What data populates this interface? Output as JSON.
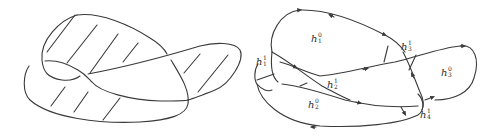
{
  "figure": {
    "left_panel": {
      "description": "hatched surface bounded by knotted curve",
      "hatch_count": 13
    },
    "right_panel": {
      "description": "handle decomposition with oriented boundary",
      "labels": [
        {
          "id": "h1_0",
          "base": "h",
          "sub": "1",
          "sup": "0",
          "x": 311,
          "y": 38
        },
        {
          "id": "h3_1",
          "base": "h",
          "sub": "3",
          "sup": "1",
          "x": 401,
          "y": 44
        },
        {
          "id": "h1_1",
          "base": "h",
          "sub": "1",
          "sup": "1",
          "x": 256,
          "y": 59
        },
        {
          "id": "h3_0",
          "base": "h",
          "sub": "3",
          "sup": "0",
          "x": 441,
          "y": 70
        },
        {
          "id": "h2_1",
          "base": "h",
          "sub": "2",
          "sup": "1",
          "x": 327,
          "y": 82
        },
        {
          "id": "h2_0",
          "base": "h",
          "sub": "2",
          "sup": "0",
          "x": 308,
          "y": 102
        },
        {
          "id": "h4_1",
          "base": "h",
          "sub": "4",
          "sup": "1",
          "x": 420,
          "y": 112
        }
      ]
    }
  }
}
